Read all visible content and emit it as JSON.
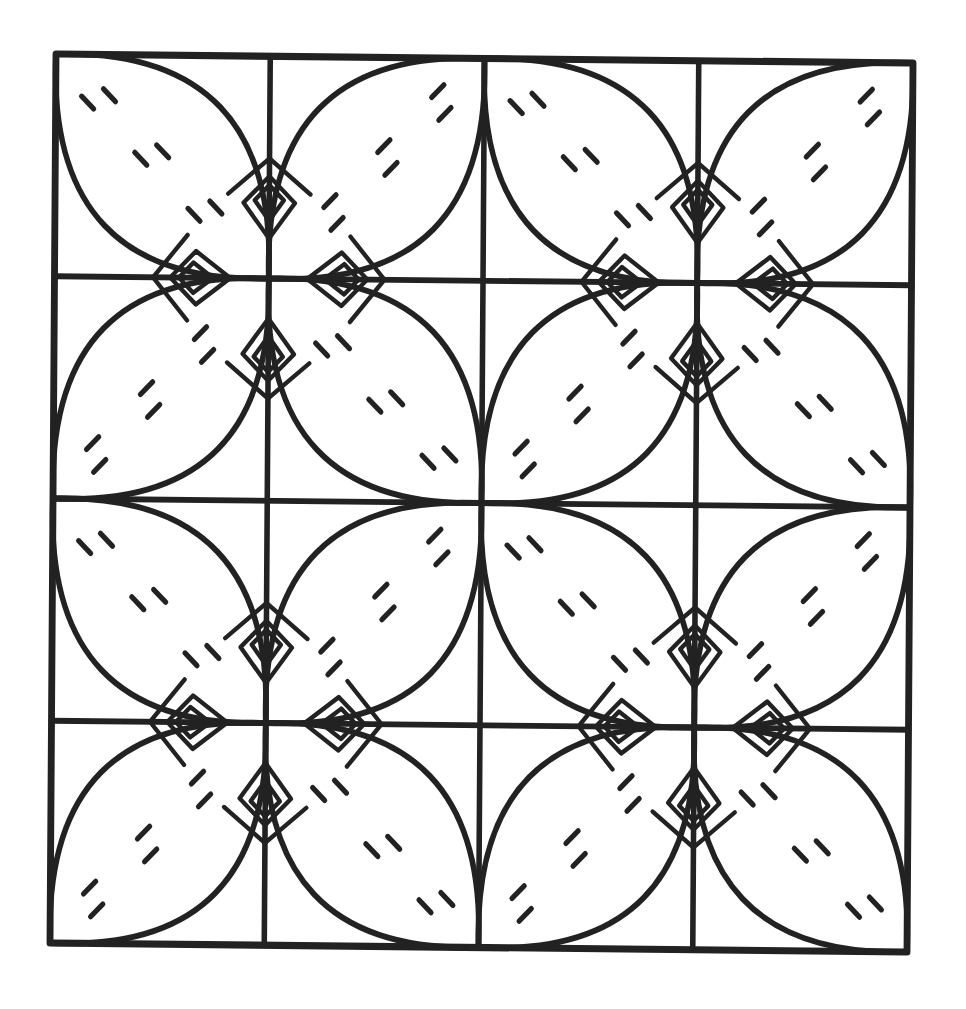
{
  "artwork": {
    "subject": "quilt-pattern-coloring-page",
    "ink_color": "#222222",
    "paper_color": "#ffffff",
    "grid": {
      "blocks_x": 2,
      "blocks_y": 2,
      "subcells_per_block": 2
    },
    "motifs": {
      "petals_per_block": 4,
      "dash_pairs_per_petal": 3,
      "kites_per_block": 4
    }
  }
}
